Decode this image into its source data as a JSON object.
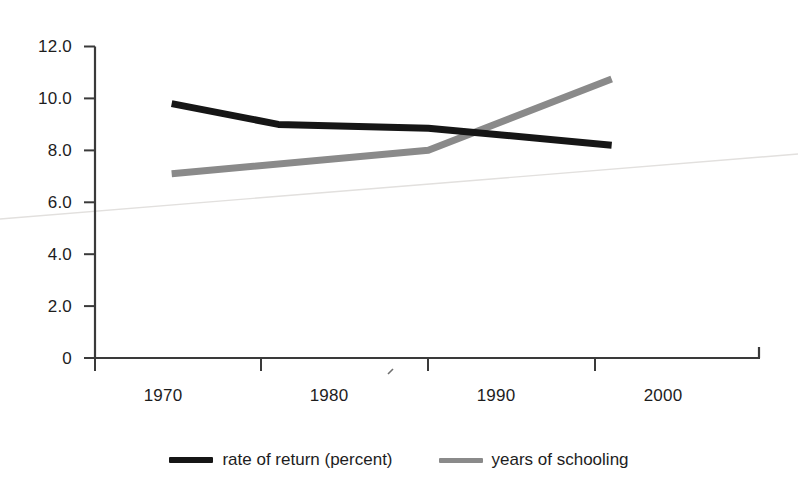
{
  "chart_data": {
    "type": "line",
    "title": "",
    "subtitle": "",
    "xlabel": "",
    "ylabel": "",
    "xlim": [
      1966,
      2006
    ],
    "ylim": [
      0,
      12
    ],
    "grid": false,
    "legend_position": "bottom-center",
    "x_ticks": [
      "1970",
      "1980",
      "1990",
      "2000"
    ],
    "x_tick_values": [
      1970,
      1980,
      1990,
      2000
    ],
    "y_ticks": [
      "0",
      "2.0",
      "4.0",
      "6.0",
      "8.0",
      "10.0",
      "12.0"
    ],
    "y_tick_values": [
      0,
      2,
      4,
      6,
      8,
      10,
      12
    ],
    "series": [
      {
        "name": "rate of return (percent)",
        "color": "#161616",
        "x": [
          1974.6,
          1981,
          1990,
          2001
        ],
        "values": [
          9.8,
          9.0,
          8.85,
          8.2
        ]
      },
      {
        "name": "years of schooling",
        "color": "#8a8a8a",
        "x": [
          1974.6,
          1990,
          2001
        ],
        "values": [
          7.1,
          8.0,
          10.75
        ]
      }
    ]
  },
  "legend": {
    "entries": [
      {
        "label": "rate of return (percent)",
        "swatch": "black-line-swatch"
      },
      {
        "label": "years of schooling",
        "swatch": "gray-line-swatch"
      }
    ]
  },
  "axes": {
    "y_labels": [
      "12.0",
      "10.0",
      "8.0",
      "6.0",
      "4.0",
      "2.0",
      "0"
    ],
    "x_labels": [
      "1970",
      "1980",
      "1990",
      "2000"
    ]
  }
}
